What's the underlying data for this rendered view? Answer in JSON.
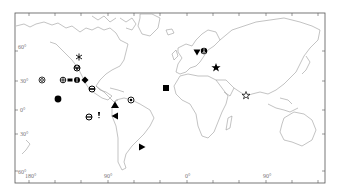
{
  "map": {
    "projection": "world equirectangular",
    "frame": {
      "left": 15,
      "top": 13,
      "right": 325,
      "bottom": 183
    },
    "latitude_labels": [
      {
        "text": "60°",
        "y": 47
      },
      {
        "text": "30°",
        "y": 82
      },
      {
        "text": "0°",
        "y": 110
      },
      {
        "text": "30°",
        "y": 135
      },
      {
        "text": "60°",
        "y": 172
      }
    ],
    "longitude_labels": [
      {
        "text": "180°",
        "x": 30
      },
      {
        "text": "90°",
        "x": 108
      },
      {
        "text": "0°",
        "x": 187
      },
      {
        "text": "90°",
        "x": 266
      }
    ],
    "markers": [
      {
        "name": "asterisk",
        "x": 79,
        "y": 57
      },
      {
        "name": "circle-bar-v",
        "x": 77,
        "y": 68
      },
      {
        "name": "double-circle",
        "x": 42,
        "y": 80
      },
      {
        "name": "circle-cross",
        "x": 63,
        "y": 80
      },
      {
        "name": "filled-bar",
        "x": 70,
        "y": 80
      },
      {
        "name": "filled-circle-cross",
        "x": 77,
        "y": 80
      },
      {
        "name": "filled-diamond",
        "x": 85,
        "y": 80
      },
      {
        "name": "circle-bar",
        "x": 92,
        "y": 89
      },
      {
        "name": "filled-circle",
        "x": 58,
        "y": 99
      },
      {
        "name": "circle-theta",
        "x": 89,
        "y": 117
      },
      {
        "name": "tack",
        "x": 99,
        "y": 115
      },
      {
        "name": "triangle-up",
        "x": 115,
        "y": 105
      },
      {
        "name": "triangle-left",
        "x": 115,
        "y": 116
      },
      {
        "name": "circle-dot",
        "x": 131,
        "y": 100
      },
      {
        "name": "triangle-right",
        "x": 142,
        "y": 147
      },
      {
        "name": "filled-square",
        "x": 166,
        "y": 88
      },
      {
        "name": "triangle-down",
        "x": 197,
        "y": 52
      },
      {
        "name": "circle-peace",
        "x": 204,
        "y": 51
      },
      {
        "name": "filled-star",
        "x": 216,
        "y": 67
      },
      {
        "name": "outline-star",
        "x": 246,
        "y": 95
      }
    ]
  }
}
